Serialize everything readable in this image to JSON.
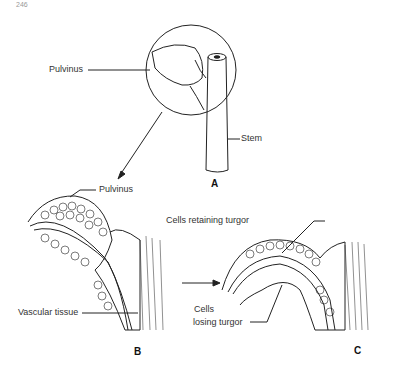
{
  "page": {
    "number": "246"
  },
  "figure": {
    "panels": [
      {
        "id": "A",
        "label": "A",
        "labels": [
          "Pulvinus",
          "Stem"
        ]
      },
      {
        "id": "B",
        "label": "B",
        "labels": [
          "Pulvinus",
          "Vascular tissue"
        ]
      },
      {
        "id": "C",
        "label": "C",
        "labels": [
          "Cells retaining turgor",
          "Cells",
          "losing turgor"
        ]
      }
    ]
  }
}
